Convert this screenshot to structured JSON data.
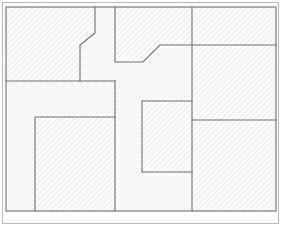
{
  "diagram": {
    "type": "space-partition-floorplan",
    "canvas": {
      "width": 282,
      "height": 228
    },
    "outer_frame": {
      "x": 2,
      "y": 2,
      "width": 277,
      "height": 222,
      "stroke": "#b9b9b9"
    },
    "content_bounds": {
      "x": 6,
      "y": 7,
      "width": 270,
      "height": 204
    },
    "colors": {
      "background": "#ffffff",
      "outline": "#6e6e6e",
      "frame": "#b9b9b9",
      "hatch_line": "#d2d2d2",
      "hatch_fill": "#fbfbfb",
      "dot_fill": "#fcfcfc",
      "dot_color": "#e0e0e0"
    },
    "patterns": {
      "hatch": {
        "name": "diagonal-hatch",
        "angle_deg": 45,
        "spacing_px": 4,
        "stroke_width": 0.7
      },
      "stipple": {
        "name": "dot-stipple",
        "spacing_px": 4,
        "dot_size_px": 1.1
      }
    },
    "regions": [
      {
        "id": "room-top-left",
        "label": "Top Left Block",
        "fill": "hatch",
        "shape": "polygon",
        "points": "6,7 95,7 95,33 80,45 80,81 6,81"
      },
      {
        "id": "room-top-middle",
        "label": "Top Middle Block",
        "fill": "hatch",
        "shape": "polygon",
        "points": "115,7 192,7 192,45 160,45 143,62 115,62"
      },
      {
        "id": "room-top-right",
        "label": "Top Right Block",
        "fill": "hatch",
        "shape": "polygon",
        "points": "192,7 276,7 276,45 192,45"
      },
      {
        "id": "room-right-middle",
        "label": "Right Middle Block",
        "fill": "hatch",
        "shape": "polygon",
        "points": "192,45 276,45 276,120 192,120"
      },
      {
        "id": "room-right-bottom",
        "label": "Right Bottom Block",
        "fill": "hatch",
        "shape": "polygon",
        "points": "192,120 276,120 276,211 192,211"
      },
      {
        "id": "room-left-lower",
        "label": "Left Lower Region",
        "fill": "stipple",
        "shape": "polygon",
        "points": "6,81 115,81 115,211 6,211"
      },
      {
        "id": "room-bottom-left",
        "label": "Bottom Left Block",
        "fill": "hatch",
        "shape": "polygon",
        "points": "35,117 115,117 115,211 35,211"
      },
      {
        "id": "room-center-block",
        "label": "Center Block",
        "fill": "hatch",
        "shape": "polygon",
        "points": "142,101 192,101 192,172 142,172"
      },
      {
        "id": "corridor",
        "label": "Corridor Region",
        "fill": "stipple",
        "shape": "composite",
        "description": "T-shaped circulation space between blocks"
      }
    ],
    "edges": [
      {
        "id": "edge-outer-top",
        "from": [
          6,
          7
        ],
        "to": [
          276,
          7
        ]
      },
      {
        "id": "edge-outer-right",
        "from": [
          276,
          7
        ],
        "to": [
          276,
          211
        ]
      },
      {
        "id": "edge-outer-bottom",
        "from": [
          276,
          211
        ],
        "to": [
          6,
          211
        ]
      },
      {
        "id": "edge-outer-left",
        "from": [
          6,
          211
        ],
        "to": [
          6,
          7
        ]
      },
      {
        "id": "edge-topleft-vertical",
        "from": [
          95,
          7
        ],
        "to": [
          95,
          33
        ]
      },
      {
        "id": "edge-topleft-chamfer",
        "from": [
          95,
          33
        ],
        "to": [
          80,
          45
        ]
      },
      {
        "id": "edge-topleft-lower-vertical",
        "from": [
          80,
          45
        ],
        "to": [
          80,
          81
        ]
      },
      {
        "id": "edge-left-horizontal",
        "from": [
          6,
          81
        ],
        "to": [
          115,
          81
        ]
      },
      {
        "id": "edge-leftlower-right-vertical",
        "from": [
          115,
          81
        ],
        "to": [
          115,
          211
        ]
      },
      {
        "id": "edge-bottomleft-top",
        "from": [
          35,
          117
        ],
        "to": [
          115,
          117
        ]
      },
      {
        "id": "edge-bottomleft-left",
        "from": [
          35,
          117
        ],
        "to": [
          35,
          211
        ]
      },
      {
        "id": "edge-topmiddle-left",
        "from": [
          115,
          7
        ],
        "to": [
          115,
          62
        ]
      },
      {
        "id": "edge-topmiddle-bottom",
        "from": [
          115,
          62
        ],
        "to": [
          143,
          62
        ]
      },
      {
        "id": "edge-topmiddle-chamfer",
        "from": [
          143,
          62
        ],
        "to": [
          160,
          45
        ]
      },
      {
        "id": "edge-mid-horizontal",
        "from": [
          160,
          45
        ],
        "to": [
          276,
          45
        ]
      },
      {
        "id": "edge-right-vertical",
        "from": [
          192,
          7
        ],
        "to": [
          192,
          211
        ]
      },
      {
        "id": "edge-right-horizontal",
        "from": [
          192,
          120
        ],
        "to": [
          276,
          120
        ]
      },
      {
        "id": "edge-center-top",
        "from": [
          142,
          101
        ],
        "to": [
          192,
          101
        ]
      },
      {
        "id": "edge-center-left",
        "from": [
          142,
          101
        ],
        "to": [
          142,
          172
        ]
      },
      {
        "id": "edge-center-bottom",
        "from": [
          142,
          172
        ],
        "to": [
          192,
          172
        ]
      }
    ]
  }
}
